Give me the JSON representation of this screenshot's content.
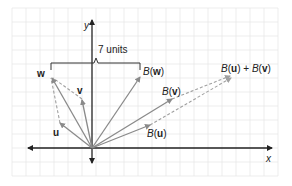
{
  "diagram": {
    "axis_labels": {
      "x": "x",
      "y": "y"
    },
    "brace_label": "7 units",
    "vectors": {
      "w": {
        "label": "w"
      },
      "v": {
        "label": "v"
      },
      "u": {
        "label": "u"
      },
      "Bw": {
        "func": "B",
        "arg": "w"
      },
      "Bv": {
        "func": "B",
        "arg": "v"
      },
      "Bu": {
        "func": "B",
        "arg": "u"
      },
      "sum": {
        "func1": "B",
        "arg1": "u",
        "plus": " + ",
        "func2": "B",
        "arg2": "v"
      }
    },
    "colors": {
      "grid": "#e6e6e6",
      "axis": "#222222",
      "vector": "#8a8a8a",
      "dashed": "#a0a0a0"
    }
  }
}
